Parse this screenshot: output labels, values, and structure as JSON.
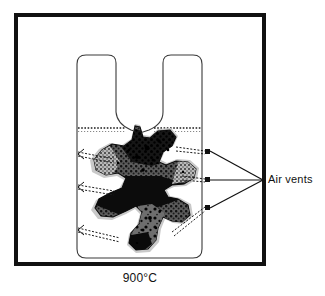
{
  "figure": {
    "type": "technical-cross-section-diagram",
    "background_color": "#ffffff",
    "ink_color": "#111111",
    "frame": {
      "name": "outer-frame",
      "x": 14,
      "y": 13,
      "width": 252,
      "height": 253,
      "stroke_width": 4,
      "stroke_color": "#111111"
    },
    "caption": {
      "temperature": "900°C"
    },
    "annotations": {
      "air_vents_label": "Air vents",
      "leader_convergence": {
        "x": 263,
        "y": 180
      },
      "vent_markers": [
        {
          "x": 208,
          "y": 152
        },
        {
          "x": 208,
          "y": 180
        },
        {
          "x": 208,
          "y": 208
        }
      ]
    },
    "vessel": {
      "name": "crucible-container",
      "stroke_color": "#3a3a3a",
      "stroke_width": 1,
      "fill": "#ffffff",
      "left_edge_x": 77,
      "right_edge_x": 202,
      "top_y": 55,
      "bottom_y": 258,
      "corner_radius": 9,
      "notch": {
        "shape": "v-notch",
        "apex_x": 140,
        "apex_y": 131,
        "left_shoulder_x": 116,
        "right_shoulder_x": 163
      }
    },
    "fill_line": {
      "name": "charge-level-line",
      "y": 128,
      "style": "dashed",
      "left_x": 78,
      "right_x": 201
    },
    "air_vent_lines": [
      {
        "id": "vent-top",
        "from_x": 78,
        "from_y": 153,
        "to_x": 112,
        "to_y": 160
      },
      {
        "id": "vent-middle",
        "from_x": 78,
        "from_y": 186,
        "to_x": 112,
        "to_y": 192
      },
      {
        "id": "vent-bottom",
        "from_x": 78,
        "from_y": 229,
        "to_x": 116,
        "to_y": 238
      }
    ],
    "right_vent_lines": [
      {
        "id": "vent-right-top",
        "from_x": 175,
        "from_y": 148,
        "to_x": 206,
        "to_y": 152
      },
      {
        "id": "vent-right-middle",
        "from_x": 180,
        "from_y": 177,
        "to_x": 206,
        "to_y": 180
      },
      {
        "id": "vent-right-bottom",
        "from_x": 176,
        "from_y": 231,
        "to_x": 206,
        "to_y": 208
      }
    ],
    "melt_mass": {
      "name": "molten-slag-mass",
      "description": "irregular amoeba / starfish shaped dark mass with halftone stipple texture occupying the lower two thirds of the vessel",
      "tone_dark": "#101010",
      "tone_mid": "#4a4a4a",
      "tone_light": "#8d8d8d",
      "halo": "#c9c9c9",
      "bounds": {
        "x": 92,
        "y": 126,
        "width": 105,
        "height": 126
      }
    }
  }
}
